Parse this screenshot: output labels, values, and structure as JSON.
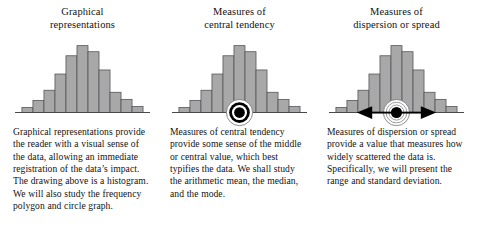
{
  "page": {
    "background_color": "#ffffff",
    "text_color": "#121212"
  },
  "figure_style": {
    "bar_fill": "#a8a8a8",
    "bar_stroke": "#55555a",
    "baseline_color": "#4a4a4a",
    "marker_black": "#000000",
    "marker_white": "#ffffff",
    "arrow_color": "#000000"
  },
  "columns": [
    {
      "id": "graphical-representations",
      "heading_line1": "Graphical",
      "heading_line2": "representations",
      "figure": {
        "name": "histogram-plain",
        "has_center_marker": false,
        "has_spread_arrow": false
      },
      "body": "Graphical representations provide the reader with a visual sense of the data, allowing an immediate registration of the data’s impact. The drawing above is a histogram. We will also study the frequency polygon and circle graph."
    },
    {
      "id": "central-tendency",
      "heading_line1": "Measures of",
      "heading_line2": "central tendency",
      "figure": {
        "name": "histogram-with-bullseye",
        "has_center_marker": true,
        "has_spread_arrow": false
      },
      "body": "Measures of central tendency provide some sense of the middle or central value, which best typifies the data. We shall study the arithmetic mean, the median, and the mode."
    },
    {
      "id": "dispersion-or-spread",
      "heading_line1": "Measures of",
      "heading_line2": "dispersion or spread",
      "figure": {
        "name": "histogram-with-bullseye-and-arrow",
        "has_center_marker": true,
        "has_spread_arrow": true
      },
      "body": "Measures of dispersion or spread provide a value that measures how widely scattered the data is. Specifically, we will present the range and standard deviation."
    }
  ],
  "chart_data": {
    "type": "bar",
    "title": "",
    "xlabel": "",
    "ylabel": "",
    "grid": false,
    "legend": null,
    "shape": "symmetric bell-shaped frequency distribution",
    "categories": [
      "1",
      "2",
      "3",
      "4",
      "5",
      "6",
      "7",
      "8",
      "9",
      "10",
      "11"
    ],
    "values": [
      5,
      12,
      22,
      38,
      56,
      66,
      60,
      42,
      20,
      13,
      6
    ],
    "ylim": [
      0,
      70
    ],
    "annotations": [
      {
        "panel": 2,
        "type": "bullseye-marker",
        "at_category": "6",
        "meaning": "center of distribution"
      },
      {
        "panel": 3,
        "type": "bullseye-marker",
        "at_category": "6",
        "meaning": "center of distribution"
      },
      {
        "panel": 3,
        "type": "double-headed-horizontal-arrow",
        "centered_on_category": "6",
        "meaning": "spread of the data"
      }
    ]
  }
}
